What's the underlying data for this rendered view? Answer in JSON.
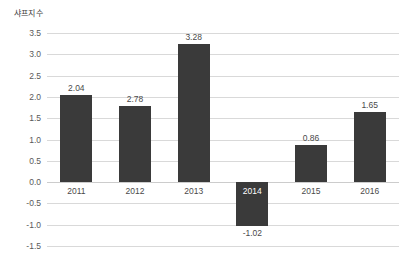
{
  "chart_data": {
    "type": "bar",
    "title": "샤프지수",
    "xlabel": "",
    "ylabel": "샤프지수",
    "categories": [
      "2011",
      "2012",
      "2013",
      "2014",
      "2015",
      "2016"
    ],
    "values": [
      2.04,
      2.78,
      3.28,
      -1.02,
      0.86,
      1.65
    ],
    "bar_tops": [
      2.04,
      1.78,
      3.25,
      -1.02,
      0.87,
      1.65
    ],
    "data_labels": [
      "2.04",
      "2.78",
      "3.28",
      "-1.02",
      "0.86",
      "1.65"
    ],
    "ylim": [
      -1.5,
      3.5
    ],
    "ytick_values": [
      3.5,
      3.0,
      2.5,
      2.0,
      1.5,
      1.0,
      0.5,
      0.0,
      -0.5,
      -1.0,
      -1.5
    ],
    "ytick_labels": [
      "3.5",
      "3.0",
      "2.5",
      "2.0",
      "1.5",
      "1.0",
      "0.5",
      "0.0",
      "-0.5",
      "-1.0",
      "-1.5"
    ],
    "grid": true,
    "legend": "none",
    "bar_color": "#3a3a3a",
    "grid_color": "#d9d9d9",
    "background_color": "#ffffff",
    "label_color": "#4a4a4a",
    "inverse_label_color": "#ffffff"
  }
}
